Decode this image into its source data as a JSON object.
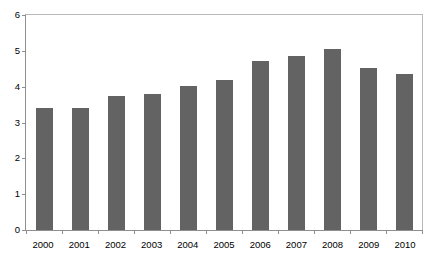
{
  "chart_data": {
    "type": "bar",
    "title": "",
    "subtitle": "",
    "xlabel": "",
    "ylabel": "",
    "categories": [
      "2000",
      "2001",
      "2002",
      "2003",
      "2004",
      "2005",
      "2006",
      "2007",
      "2008",
      "2009",
      "2010"
    ],
    "values": [
      3.4,
      3.4,
      3.73,
      3.8,
      4.02,
      4.2,
      4.72,
      4.85,
      5.05,
      4.53,
      4.36
    ],
    "series": [
      {
        "name": "",
        "values": [
          3.4,
          3.4,
          3.73,
          3.8,
          4.02,
          4.2,
          4.72,
          4.85,
          5.05,
          4.53,
          4.36
        ],
        "color": "#636363"
      }
    ],
    "ylim": [
      0,
      6
    ],
    "yticks": [
      "0",
      "1",
      "2",
      "3",
      "4",
      "5",
      "6"
    ],
    "ytick_values": [
      0,
      1,
      2,
      3,
      4,
      5,
      6
    ],
    "xlim_categories": 11,
    "grid": false,
    "legend": null,
    "legend_position": "none",
    "annotations": [],
    "bar_color": "#636363",
    "axis_color": "#8f8f8f",
    "plot_border_color": "#b9b9b9",
    "background_color": "#ffffff"
  }
}
